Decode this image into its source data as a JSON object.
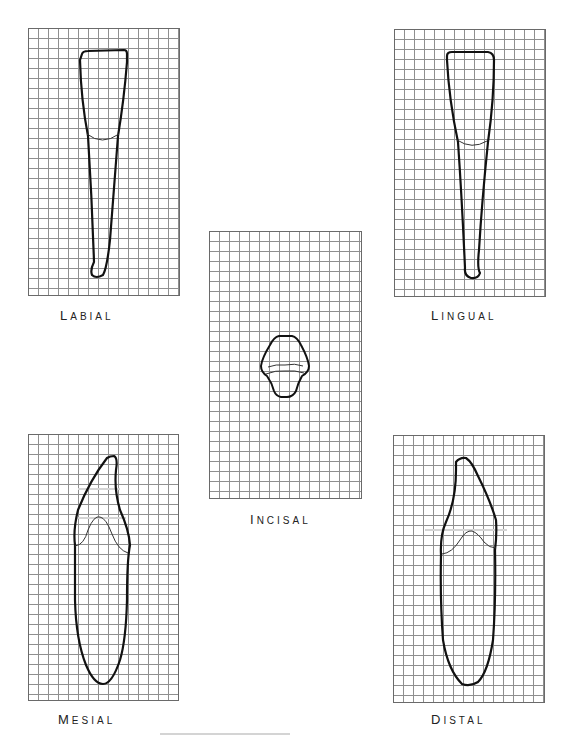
{
  "views": {
    "labial": {
      "label_first": "L",
      "label_rest": "ABIAL"
    },
    "lingual": {
      "label_first": "L",
      "label_rest": "INGUAL"
    },
    "incisal": {
      "label_first": "I",
      "label_rest": "NCISAL"
    },
    "mesial": {
      "label_first": "M",
      "label_rest": "ESIAL"
    },
    "distal": {
      "label_first": "D",
      "label_rest": "ISTAL"
    }
  },
  "grid": {
    "cell_size_px": 10,
    "columns": 15,
    "rows": 27,
    "line_color": "#8f8f8f"
  },
  "colors": {
    "outline": "#111111",
    "cej_line": "#333333",
    "guide_line": "#bdbdbd",
    "background": "#ffffff"
  }
}
